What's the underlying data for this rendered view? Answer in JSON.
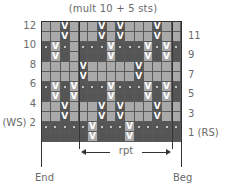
{
  "chart": {
    "title": "(mult 10 + 5 sts)",
    "columns": 15,
    "rows": 12,
    "left_labels": [
      {
        "row": 12,
        "text": "12"
      },
      {
        "row": 10,
        "text": "10"
      },
      {
        "row": 8,
        "text": "8"
      },
      {
        "row": 6,
        "text": "6"
      },
      {
        "row": 4,
        "text": "4"
      },
      {
        "row": 2,
        "text": "(WS) 2"
      }
    ],
    "right_labels": [
      {
        "row": 11,
        "text": "11"
      },
      {
        "row": 9,
        "text": "9"
      },
      {
        "row": 7,
        "text": "7"
      },
      {
        "row": 5,
        "text": "5"
      },
      {
        "row": 3,
        "text": "3"
      },
      {
        "row": 1,
        "text": "1 (RS)"
      }
    ],
    "repeat_label": "rpt",
    "end_label": "End",
    "beg_label": "Beg",
    "colors": {
      "light": "#a9a9a9",
      "dark": "#555555",
      "symbol": "#ffffff",
      "grid_line": "#5a5a5a"
    },
    "symbols": {
      "slip": "V",
      "purl_dot": "dot-icon"
    },
    "row_color": {
      "1": "dark",
      "2": "dark",
      "3": "light",
      "4": "light",
      "5": "dark",
      "6": "dark",
      "7": "light",
      "8": "light",
      "9": "dark",
      "10": "dark",
      "11": "light",
      "12": "light"
    },
    "slip_columns": {
      "1": [
        6,
        10
      ],
      "2": [
        6,
        10
      ],
      "3": [
        3,
        7,
        9,
        13
      ],
      "4": [
        3,
        7,
        9,
        13
      ],
      "5": [
        2,
        4,
        8,
        12,
        14
      ],
      "6": [
        2,
        4,
        8,
        12,
        14
      ],
      "7": [
        5,
        11
      ],
      "8": [
        5,
        11
      ],
      "9": [
        2,
        8,
        12,
        14
      ],
      "10": [
        2,
        8,
        12,
        14
      ],
      "11": [
        3,
        7,
        9,
        13
      ],
      "12": [
        3,
        7,
        9,
        13
      ]
    },
    "plain_contrast_columns": {
      "9": [
        4
      ],
      "10": [
        4
      ]
    },
    "dot_rows": [
      2,
      6,
      10
    ]
  }
}
